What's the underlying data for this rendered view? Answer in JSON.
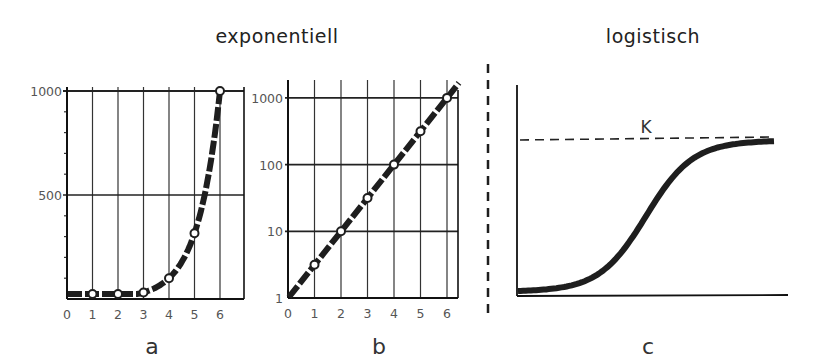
{
  "titles": {
    "left": "exponentiell",
    "right": "logistisch"
  },
  "colors": {
    "ink": "#1e1e1e",
    "grid": "#333333",
    "text": "#444444",
    "background": "#ffffff"
  },
  "chart_data": [
    {
      "id": "a",
      "type": "line",
      "panel_label": "a",
      "group_title": "exponentiell",
      "title": "",
      "xlabel": "",
      "ylabel": "",
      "yscale": "linear",
      "x_ticks": [
        "0",
        "1",
        "2",
        "3",
        "4",
        "5",
        "6"
      ],
      "y_ticks": [
        "500",
        "1000"
      ],
      "xlim": [
        0,
        6.95
      ],
      "ylim": [
        0,
        1000
      ],
      "grid": true,
      "series": [
        {
          "name": "exponentielles Wachstum (2^x ≈ 10^(x/2))",
          "style": "thick dashed, open circle markers",
          "x": [
            1,
            2,
            3,
            4,
            5,
            6
          ],
          "values": [
            3.16,
            10,
            31.6,
            100,
            316,
            1000
          ]
        }
      ]
    },
    {
      "id": "b",
      "type": "line",
      "panel_label": "b",
      "group_title": "exponentiell",
      "title": "",
      "xlabel": "",
      "ylabel": "",
      "yscale": "log",
      "x_ticks": [
        "0",
        "1",
        "2",
        "3",
        "4",
        "5",
        "6"
      ],
      "y_ticks": [
        "1",
        "10",
        "100",
        "1000"
      ],
      "xlim": [
        0,
        6.4
      ],
      "ylim": [
        1,
        1000
      ],
      "grid": true,
      "series": [
        {
          "name": "exponentielles Wachstum (logarithmische Ordinate)",
          "style": "thick dashed straight line, open circle markers",
          "x": [
            0,
            1,
            2,
            3,
            4,
            5,
            6
          ],
          "values": [
            1,
            3.16,
            10,
            31.6,
            100,
            316,
            1000
          ]
        }
      ]
    },
    {
      "id": "c",
      "type": "line",
      "panel_label": "c",
      "group_title": "logistisch",
      "title": "",
      "xlabel": "",
      "ylabel": "",
      "yscale": "linear",
      "x_ticks": [],
      "y_ticks": [],
      "grid": false,
      "annotations": [
        {
          "text": "K",
          "meaning": "Kapazitätsgrenze (dashed asymptote)"
        }
      ],
      "series": [
        {
          "name": "logistisches Wachstum (S-Kurve)",
          "style": "thick solid",
          "x_rel": [
            0,
            0.1,
            0.2,
            0.3,
            0.4,
            0.45,
            0.5,
            0.55,
            0.6,
            0.7,
            0.8,
            0.9,
            1.0
          ],
          "values_rel_to_K": [
            0.03,
            0.05,
            0.08,
            0.14,
            0.3,
            0.45,
            0.6,
            0.72,
            0.81,
            0.9,
            0.94,
            0.96,
            0.97
          ]
        }
      ]
    }
  ]
}
